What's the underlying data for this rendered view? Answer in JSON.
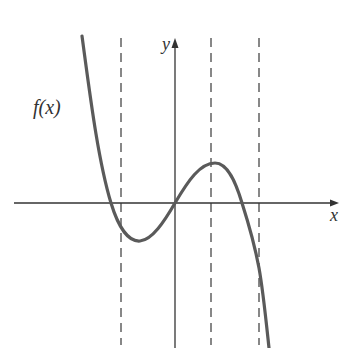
{
  "diagram": {
    "title": "",
    "function_label": "f(x)",
    "x_axis_label": "x",
    "y_axis_label": "y",
    "colors": {
      "curve": "#5a5a5a",
      "axes": "#333333",
      "dashed": "#555555",
      "text": "#333333",
      "background": "#ffffff"
    },
    "dashed_lines": [
      {
        "name": "left-dashed-line",
        "note": "left of y-axis, near where curve crosses below x-axis"
      },
      {
        "name": "middle-dashed-line",
        "note": "through local maximum"
      },
      {
        "name": "right-dashed-line",
        "note": "right of the second x-intercept"
      }
    ],
    "features": {
      "local_minimum": "left of y-axis, below x-axis",
      "local_maximum": "right of y-axis, above x-axis",
      "passes_through_origin": true,
      "x_intercepts": 3
    }
  }
}
